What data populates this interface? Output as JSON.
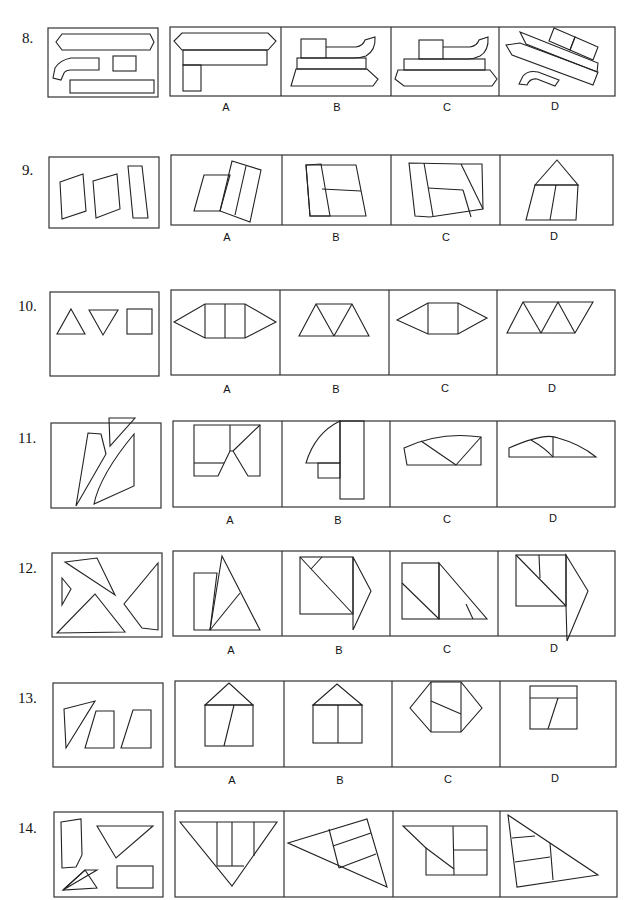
{
  "questions": [
    {
      "number": "8.",
      "options": [
        "A",
        "B",
        "C",
        "D"
      ]
    },
    {
      "number": "9.",
      "options": [
        "A",
        "B",
        "C",
        "D"
      ]
    },
    {
      "number": "10.",
      "options": [
        "A",
        "B",
        "C",
        "D"
      ]
    },
    {
      "number": "11.",
      "options": [
        "A",
        "B",
        "C",
        "D"
      ]
    },
    {
      "number": "12.",
      "options": [
        "A",
        "B",
        "C",
        "D"
      ]
    },
    {
      "number": "13.",
      "options": [
        "A",
        "B",
        "C",
        "D"
      ]
    },
    {
      "number": "14.",
      "options": [
        "A",
        "B",
        "C",
        "D"
      ]
    }
  ],
  "figure_descriptions": {
    "8": {
      "given": [
        "elongated hexagon",
        "curved L-shaped piece",
        "small rectangle",
        "long rectangle"
      ],
      "A": "hexagon on top of long bar with vertical rectangle",
      "B": "boat-like stack with curved chimney",
      "C": "boat-like stack with hexagon base and curved chimney",
      "D": "tilted composite with curved piece"
    },
    "9": {
      "given": [
        "parallelogram",
        "parallelogram",
        "tall thin rectangle"
      ]
    },
    "10": {
      "given": [
        "upward triangle",
        "downward triangle",
        "square"
      ]
    },
    "11": {
      "given": [
        "quadrilateral",
        "small triangle",
        "curved-edge piece"
      ]
    },
    "12": {
      "given": [
        "triangle",
        "small triangle",
        "large triangle",
        "quadrilateral"
      ]
    },
    "13": {
      "given": [
        "triangle",
        "trapezoid",
        "trapezoid"
      ]
    },
    "14": {
      "given": [
        "pentagon",
        "inverted triangle",
        "small triangle",
        "rectangle"
      ]
    }
  },
  "colors": {
    "line": "#222222",
    "background": "#ffffff"
  }
}
